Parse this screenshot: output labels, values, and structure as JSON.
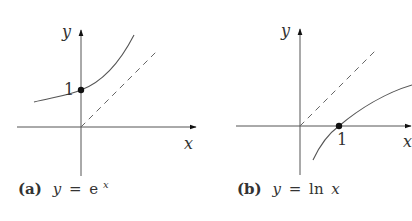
{
  "figures": [
    {
      "id": "a",
      "caption_tag": "(a)",
      "caption_eq_lhs": "y",
      "caption_eq_op": "=",
      "caption_eq_base": "e",
      "caption_eq_exp": "x",
      "axis_x_label": "x",
      "axis_y_label": "y",
      "point_label": "1",
      "function": "exp",
      "point": [
        0,
        1
      ]
    },
    {
      "id": "b",
      "caption_tag": "(b)",
      "caption_eq_lhs": "y",
      "caption_eq_op": "=",
      "caption_eq_fn": "ln",
      "caption_eq_arg": "x",
      "axis_x_label": "x",
      "axis_y_label": "y",
      "point_label": "1",
      "function": "ln",
      "point": [
        1,
        0
      ]
    }
  ],
  "reference_line": "y = x (dashed)",
  "colors": {
    "ink": "#333333",
    "background": "#ffffff"
  }
}
